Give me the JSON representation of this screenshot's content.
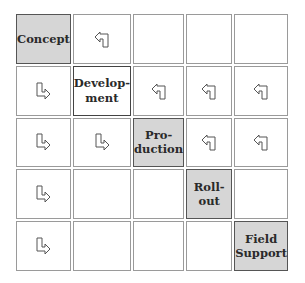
{
  "diagram": {
    "type": "waterfall-matrix",
    "rows": 5,
    "cols": 5,
    "colors": {
      "phase_fill": "#d6d6d6",
      "cell_border": "#9a9a9a",
      "text": "#2a2a2a"
    },
    "cells": [
      [
        {
          "kind": "phase",
          "label": "Concept"
        },
        {
          "kind": "arrow-back"
        },
        {
          "kind": "empty"
        },
        {
          "kind": "empty"
        },
        {
          "kind": "empty"
        }
      ],
      [
        {
          "kind": "arrow-forward"
        },
        {
          "kind": "phase-outlined",
          "label": "Develop-\nment"
        },
        {
          "kind": "arrow-back"
        },
        {
          "kind": "arrow-back"
        },
        {
          "kind": "arrow-back"
        }
      ],
      [
        {
          "kind": "arrow-forward"
        },
        {
          "kind": "arrow-forward"
        },
        {
          "kind": "phase",
          "label": "Pro-\nduction"
        },
        {
          "kind": "arrow-back"
        },
        {
          "kind": "arrow-back"
        }
      ],
      [
        {
          "kind": "arrow-forward"
        },
        {
          "kind": "empty"
        },
        {
          "kind": "empty"
        },
        {
          "kind": "phase",
          "label": "Roll-out"
        },
        {
          "kind": "empty"
        }
      ],
      [
        {
          "kind": "arrow-forward"
        },
        {
          "kind": "empty"
        },
        {
          "kind": "empty"
        },
        {
          "kind": "empty"
        },
        {
          "kind": "phase",
          "label": "Field\nSupport"
        }
      ]
    ],
    "phases": [
      "Concept",
      "Development",
      "Production",
      "Roll-out",
      "Field Support"
    ]
  }
}
